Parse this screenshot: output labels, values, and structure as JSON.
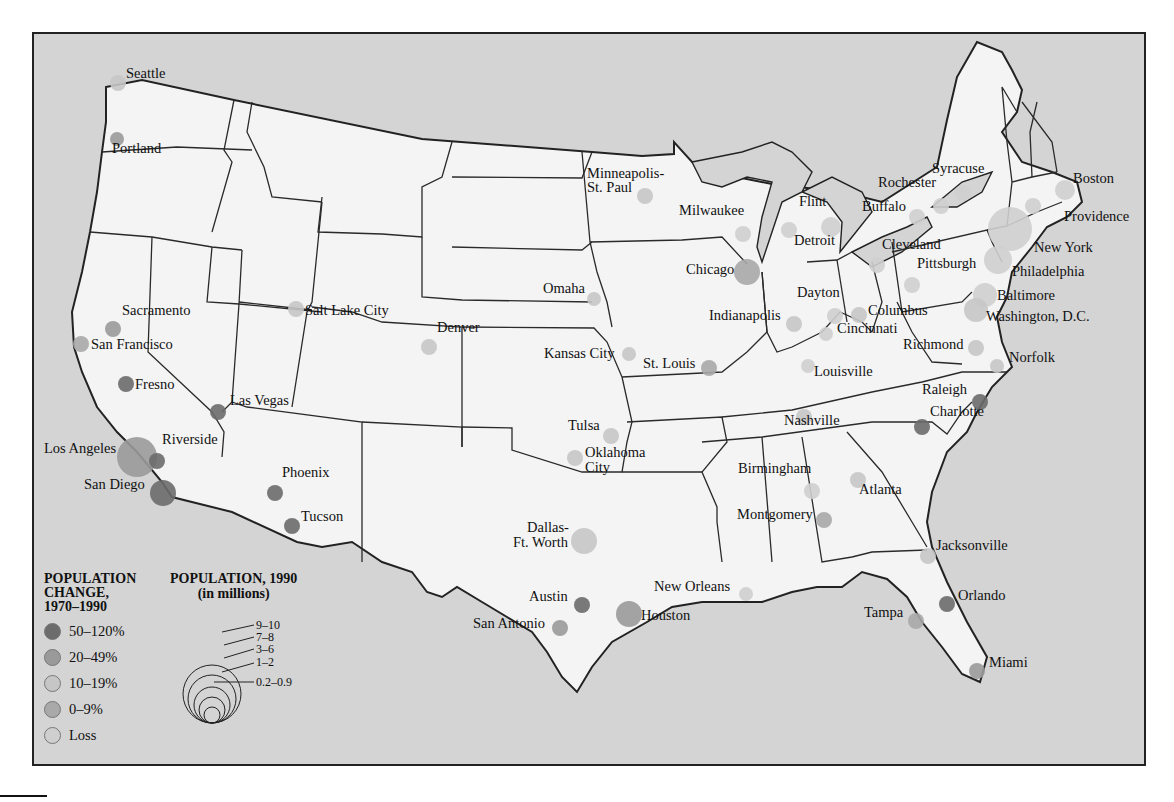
{
  "map": {
    "colors": {
      "water": "#d4d4d4",
      "land": "#f4f4f4",
      "border": "#2a2a2a",
      "change_50_120": "#6c6c6c",
      "change_20_49": "#9a9a9a",
      "change_10_19": "#c6c6c6",
      "change_0_9": "#a9a9a9",
      "change_loss": "#cfcfcf"
    },
    "cities": [
      {
        "name": "Seattle",
        "x": 116,
        "y": 81,
        "r": 8,
        "change": "10-19%"
      },
      {
        "name": "Portland",
        "x": 115,
        "y": 137,
        "r": 7,
        "change": "20-49%"
      },
      {
        "name": "Sacramento",
        "x": 111,
        "y": 327,
        "r": 8,
        "change": "20-49%"
      },
      {
        "name": "San Francisco",
        "x": 79,
        "y": 342,
        "r": 8,
        "change": "0-9%"
      },
      {
        "name": "Fresno",
        "x": 124,
        "y": 382,
        "r": 8,
        "change": "50-120%"
      },
      {
        "name": "Las Vegas",
        "x": 216,
        "y": 410,
        "r": 8,
        "change": "50-120%"
      },
      {
        "name": "Los Angeles",
        "x": 135,
        "y": 455,
        "r": 20,
        "change": "20-49%"
      },
      {
        "name": "Riverside",
        "x": 155,
        "y": 459,
        "r": 8,
        "change": "50-120%"
      },
      {
        "name": "San Diego",
        "x": 161,
        "y": 491,
        "r": 13,
        "change": "50-120%"
      },
      {
        "name": "Phoenix",
        "x": 273,
        "y": 491,
        "r": 8,
        "change": "50-120%"
      },
      {
        "name": "Tucson",
        "x": 290,
        "y": 524,
        "r": 8,
        "change": "50-120%"
      },
      {
        "name": "Salt Lake City",
        "x": 294,
        "y": 307,
        "r": 8,
        "change": "10-19%"
      },
      {
        "name": "Denver",
        "x": 427,
        "y": 345,
        "r": 8,
        "change": "10-19%"
      },
      {
        "name": "Minneapolis-St. Paul",
        "x": 643,
        "y": 194,
        "r": 8,
        "change": "10-19%"
      },
      {
        "name": "Omaha",
        "x": 592,
        "y": 297,
        "r": 7,
        "change": "10-19%"
      },
      {
        "name": "Kansas City",
        "x": 627,
        "y": 352,
        "r": 7,
        "change": "10-19%"
      },
      {
        "name": "St. Louis",
        "x": 707,
        "y": 366,
        "r": 8,
        "change": "0-9%"
      },
      {
        "name": "Milwaukee",
        "x": 741,
        "y": 232,
        "r": 8,
        "change": "Loss"
      },
      {
        "name": "Chicago",
        "x": 745,
        "y": 270,
        "r": 13,
        "change": "0-9%"
      },
      {
        "name": "Flint",
        "x": 787,
        "y": 228,
        "r": 8,
        "change": "Loss"
      },
      {
        "name": "Detroit",
        "x": 829,
        "y": 225,
        "r": 10,
        "change": "Loss"
      },
      {
        "name": "Indianapolis",
        "x": 792,
        "y": 322,
        "r": 8,
        "change": "10-19%"
      },
      {
        "name": "Dayton",
        "x": 833,
        "y": 314,
        "r": 8,
        "change": "Loss"
      },
      {
        "name": "Columbus",
        "x": 857,
        "y": 313,
        "r": 8,
        "change": "10-19%"
      },
      {
        "name": "Cincinnati",
        "x": 824,
        "y": 332,
        "r": 7,
        "change": "Loss"
      },
      {
        "name": "Louisville",
        "x": 806,
        "y": 364,
        "r": 7,
        "change": "Loss"
      },
      {
        "name": "Nashville",
        "x": 802,
        "y": 415,
        "r": 8,
        "change": "10-19%"
      },
      {
        "name": "Cleveland",
        "x": 875,
        "y": 263,
        "r": 8,
        "change": "Loss"
      },
      {
        "name": "Buffalo",
        "x": 915,
        "y": 215,
        "r": 8,
        "change": "Loss"
      },
      {
        "name": "Rochester",
        "x": 939,
        "y": 204,
        "r": 8,
        "change": "Loss"
      },
      {
        "name": "Syracuse",
        "x": 961,
        "y": 191,
        "r": 8,
        "change": "Loss"
      },
      {
        "name": "Pittsburgh",
        "x": 910,
        "y": 283,
        "r": 8,
        "change": "Loss"
      },
      {
        "name": "Boston",
        "x": 1063,
        "y": 188,
        "r": 10,
        "change": "Loss"
      },
      {
        "name": "Providence",
        "x": 1031,
        "y": 204,
        "r": 8,
        "change": "Loss"
      },
      {
        "name": "New York",
        "x": 1008,
        "y": 227,
        "r": 22,
        "change": "Loss"
      },
      {
        "name": "Philadelphia",
        "x": 996,
        "y": 258,
        "r": 14,
        "change": "Loss"
      },
      {
        "name": "Baltimore",
        "x": 983,
        "y": 293,
        "r": 12,
        "change": "Loss"
      },
      {
        "name": "Washington, D.C.",
        "x": 974,
        "y": 308,
        "r": 12,
        "change": "10-19%"
      },
      {
        "name": "Richmond",
        "x": 974,
        "y": 346,
        "r": 8,
        "change": "10-19%"
      },
      {
        "name": "Norfolk",
        "x": 995,
        "y": 364,
        "r": 7,
        "change": "10-19%"
      },
      {
        "name": "Raleigh",
        "x": 978,
        "y": 400,
        "r": 8,
        "change": "50-120%"
      },
      {
        "name": "Charlotte",
        "x": 920,
        "y": 425,
        "r": 8,
        "change": "50-120%"
      },
      {
        "name": "Atlanta",
        "x": 856,
        "y": 478,
        "r": 8,
        "change": "10-19%"
      },
      {
        "name": "Birmingham",
        "x": 810,
        "y": 489,
        "r": 8,
        "change": "Loss"
      },
      {
        "name": "Montgomery",
        "x": 822,
        "y": 518,
        "r": 8,
        "change": "0-9%"
      },
      {
        "name": "Jacksonville",
        "x": 926,
        "y": 554,
        "r": 8,
        "change": "10-19%"
      },
      {
        "name": "Orlando",
        "x": 945,
        "y": 602,
        "r": 8,
        "change": "50-120%"
      },
      {
        "name": "Tampa",
        "x": 914,
        "y": 619,
        "r": 8,
        "change": "0-9%"
      },
      {
        "name": "Miami",
        "x": 975,
        "y": 669,
        "r": 8,
        "change": "20-49%"
      },
      {
        "name": "Tulsa",
        "x": 609,
        "y": 434,
        "r": 8,
        "change": "10-19%"
      },
      {
        "name": "Oklahoma City",
        "x": 573,
        "y": 456,
        "r": 8,
        "change": "10-19%"
      },
      {
        "name": "Dallas-Ft. Worth",
        "x": 582,
        "y": 539,
        "r": 13,
        "change": "10-19%"
      },
      {
        "name": "Austin",
        "x": 580,
        "y": 603,
        "r": 8,
        "change": "50-120%"
      },
      {
        "name": "San Antonio",
        "x": 558,
        "y": 626,
        "r": 8,
        "change": "20-49%"
      },
      {
        "name": "Houston",
        "x": 627,
        "y": 612,
        "r": 13,
        "change": "20-49%"
      },
      {
        "name": "New Orleans",
        "x": 744,
        "y": 592,
        "r": 7,
        "change": "Loss"
      }
    ],
    "labels": [
      {
        "text": "Seattle",
        "x": 124,
        "y": 72
      },
      {
        "text": "Portland",
        "x": 110,
        "y": 147
      },
      {
        "text": "Minneapolis-",
        "x": 585,
        "y": 172
      },
      {
        "text": "St. Paul",
        "x": 585,
        "y": 186
      },
      {
        "text": "Milwaukee",
        "x": 677,
        "y": 209
      },
      {
        "text": "Flint",
        "x": 797,
        "y": 200
      },
      {
        "text": "Detroit",
        "x": 792,
        "y": 239
      },
      {
        "text": "Rochester",
        "x": 876,
        "y": 181
      },
      {
        "text": "Syracuse",
        "x": 930,
        "y": 167
      },
      {
        "text": "Buffalo",
        "x": 860,
        "y": 205
      },
      {
        "text": "Boston",
        "x": 1071,
        "y": 177
      },
      {
        "text": "Providence",
        "x": 1062,
        "y": 215
      },
      {
        "text": "Cleveland",
        "x": 880,
        "y": 243
      },
      {
        "text": "New York",
        "x": 1032,
        "y": 246
      },
      {
        "text": "Chicago",
        "x": 684,
        "y": 268
      },
      {
        "text": "Pittsburgh",
        "x": 915,
        "y": 262
      },
      {
        "text": "Philadelphia",
        "x": 1010,
        "y": 270
      },
      {
        "text": "Omaha",
        "x": 541,
        "y": 287
      },
      {
        "text": "Dayton",
        "x": 795,
        "y": 291
      },
      {
        "text": "Baltimore",
        "x": 995,
        "y": 294
      },
      {
        "text": "Sacramento",
        "x": 120,
        "y": 309
      },
      {
        "text": "Salt Lake City",
        "x": 303,
        "y": 309
      },
      {
        "text": "Indianapolis",
        "x": 707,
        "y": 314
      },
      {
        "text": "Columbus",
        "x": 866,
        "y": 309
      },
      {
        "text": "Washington, D.C.",
        "x": 984,
        "y": 315
      },
      {
        "text": "Denver",
        "x": 435,
        "y": 326
      },
      {
        "text": "Cincinnati",
        "x": 835,
        "y": 327
      },
      {
        "text": "San Francisco",
        "x": 89,
        "y": 343
      },
      {
        "text": "Kansas City",
        "x": 542,
        "y": 352
      },
      {
        "text": "Richmond",
        "x": 901,
        "y": 343
      },
      {
        "text": "St. Louis",
        "x": 641,
        "y": 362
      },
      {
        "text": "Norfolk",
        "x": 1007,
        "y": 356
      },
      {
        "text": "Louisville",
        "x": 812,
        "y": 370
      },
      {
        "text": "Fresno",
        "x": 133,
        "y": 383
      },
      {
        "text": "Las Vegas",
        "x": 228,
        "y": 399
      },
      {
        "text": "Raleigh",
        "x": 920,
        "y": 388
      },
      {
        "text": "Nashville",
        "x": 782,
        "y": 419
      },
      {
        "text": "Charlotte",
        "x": 928,
        "y": 410
      },
      {
        "text": "Riverside",
        "x": 160,
        "y": 438
      },
      {
        "text": "Tulsa",
        "x": 566,
        "y": 424
      },
      {
        "text": "Los Angeles",
        "x": 42,
        "y": 447
      },
      {
        "text": "Oklahoma",
        "x": 583,
        "y": 451
      },
      {
        "text": "City",
        "x": 583,
        "y": 466
      },
      {
        "text": "Birmingham",
        "x": 736,
        "y": 467
      },
      {
        "text": "Phoenix",
        "x": 280,
        "y": 471
      },
      {
        "text": "San Diego",
        "x": 82,
        "y": 483
      },
      {
        "text": "Atlanta",
        "x": 857,
        "y": 488
      },
      {
        "text": "Tucson",
        "x": 299,
        "y": 515
      },
      {
        "text": "Montgomery",
        "x": 735,
        "y": 513
      },
      {
        "text": "Dallas-",
        "x": 525,
        "y": 526
      },
      {
        "text": "Ft. Worth",
        "x": 511,
        "y": 541
      },
      {
        "text": "Jacksonville",
        "x": 934,
        "y": 544
      },
      {
        "text": "New Orleans",
        "x": 652,
        "y": 585
      },
      {
        "text": "Austin",
        "x": 527,
        "y": 595
      },
      {
        "text": "Orlando",
        "x": 956,
        "y": 594
      },
      {
        "text": "San Antonio",
        "x": 471,
        "y": 622
      },
      {
        "text": "Houston",
        "x": 639,
        "y": 614
      },
      {
        "text": "Tampa",
        "x": 862,
        "y": 611
      },
      {
        "text": "Miami",
        "x": 987,
        "y": 661
      }
    ]
  },
  "legend": {
    "change_title_1": "POPULATION",
    "change_title_2": "CHANGE,",
    "change_title_3": "1970–1990",
    "change_items": [
      {
        "label": "50–120%",
        "color": "#6c6c6c"
      },
      {
        "label": "20–49%",
        "color": "#9a9a9a"
      },
      {
        "label": "10–19%",
        "color": "#c6c6c6"
      },
      {
        "label": "0–9%",
        "color": "#a9a9a9"
      },
      {
        "label": "Loss",
        "color": "#cfcfcf"
      }
    ],
    "size_title_1": "POPULATION, 1990",
    "size_title_2": "(in millions)",
    "size_items": [
      "9–10",
      "7–8",
      "3–6",
      "1–2",
      "0.2–0.9"
    ]
  }
}
